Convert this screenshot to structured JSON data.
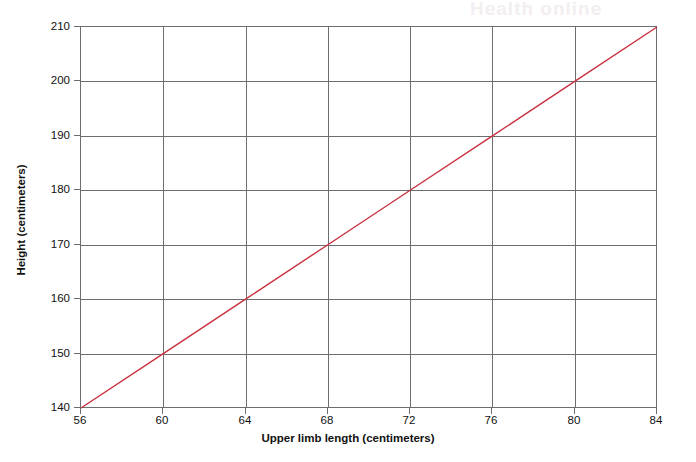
{
  "chart_data": {
    "type": "line",
    "title": "",
    "xlabel": "Upper limb length (centimeters)",
    "ylabel": "Height (centimeters)",
    "xlim": [
      56,
      84
    ],
    "ylim": [
      140,
      210
    ],
    "xticks": [
      56,
      60,
      64,
      68,
      72,
      76,
      80,
      84
    ],
    "yticks": [
      140,
      150,
      160,
      170,
      180,
      190,
      200,
      210
    ],
    "xtick_labels": [
      "56",
      "60",
      "64",
      "68",
      "72",
      "76",
      "80",
      "84"
    ],
    "ytick_labels": [
      "140",
      "150",
      "160",
      "170",
      "180",
      "190",
      "200",
      "210"
    ],
    "grid": true,
    "legend": false,
    "legend_position": "none",
    "series": [
      {
        "name": "Height vs upper limb length",
        "color": "#c9303f",
        "style": "solid",
        "width": 1.4,
        "x": [
          56,
          60,
          64,
          68,
          72,
          76,
          80,
          84
        ],
        "values": [
          140,
          150,
          160,
          170,
          180,
          190,
          200,
          210
        ]
      }
    ],
    "annotations": [],
    "slope": 2.5,
    "intercept": 0
  },
  "colors": {
    "line": "#c9303f",
    "grid": "#6e6e6e",
    "axis": "#6e6e6e",
    "text": "#111111",
    "background": "#ffffff"
  },
  "watermark": {
    "text": "Health online"
  }
}
